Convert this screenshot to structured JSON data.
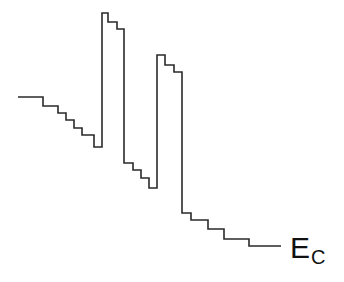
{
  "diagram": {
    "type": "energy-band-profile",
    "line_color": "#2a2a2a",
    "label": {
      "main": "E",
      "subscript": "C",
      "full": "E_C"
    },
    "path_points": [
      [
        18,
        97
      ],
      [
        43,
        97
      ],
      [
        43,
        106
      ],
      [
        58,
        106
      ],
      [
        58,
        113
      ],
      [
        66,
        113
      ],
      [
        66,
        120
      ],
      [
        74,
        120
      ],
      [
        74,
        128
      ],
      [
        82,
        128
      ],
      [
        82,
        135
      ],
      [
        94,
        135
      ],
      [
        94,
        147
      ],
      [
        102,
        147
      ],
      [
        102,
        13
      ],
      [
        108,
        13
      ],
      [
        108,
        22
      ],
      [
        117,
        22
      ],
      [
        117,
        29
      ],
      [
        124,
        29
      ],
      [
        124,
        163
      ],
      [
        133,
        163
      ],
      [
        133,
        170
      ],
      [
        141,
        170
      ],
      [
        141,
        178
      ],
      [
        149,
        178
      ],
      [
        149,
        188
      ],
      [
        157,
        188
      ],
      [
        157,
        55
      ],
      [
        165,
        55
      ],
      [
        165,
        65
      ],
      [
        174,
        65
      ],
      [
        174,
        72
      ],
      [
        182,
        72
      ],
      [
        182,
        213
      ],
      [
        191,
        213
      ],
      [
        191,
        220
      ],
      [
        208,
        220
      ],
      [
        208,
        229
      ],
      [
        224,
        229
      ],
      [
        224,
        239
      ],
      [
        249,
        239
      ],
      [
        249,
        246
      ],
      [
        281,
        246
      ]
    ]
  }
}
